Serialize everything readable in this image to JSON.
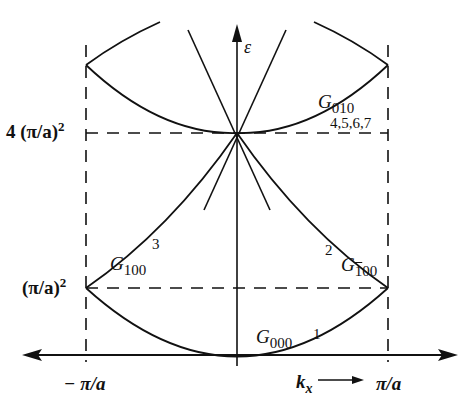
{
  "diagram": {
    "title": "",
    "type": "band structure (empty lattice, reduced zone)",
    "axes": {
      "y_label": "ε",
      "x_label": "k",
      "x_label_sub": "x",
      "x_ticks": [
        "− π/a",
        "π/a"
      ],
      "y_ticks": [
        "(π/a)",
        "4 (π/a)"
      ],
      "y_tick_exponent": "2"
    },
    "bands": [
      {
        "name": "G",
        "sub": "000",
        "index": "1"
      },
      {
        "name": "G",
        "sub_overline": "1",
        "sub_rest": "00",
        "index": "2"
      },
      {
        "name": "G",
        "sub": "100",
        "index": "3"
      },
      {
        "name": "G",
        "sub": "010",
        "index": "4,5,6,7"
      }
    ],
    "colors": {
      "line": "#111111",
      "background": "#ffffff"
    }
  }
}
